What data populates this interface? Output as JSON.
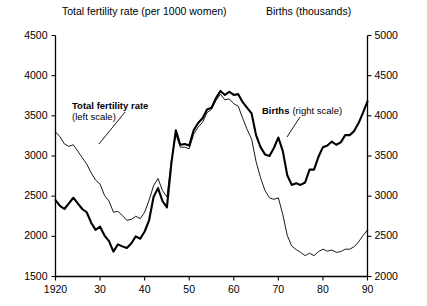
{
  "chart_data": {
    "type": "line",
    "title": "",
    "titles": {
      "left": "Total fertility rate (per 1000 women)",
      "right": "Births (thousands)"
    },
    "xlabel": "",
    "ylabel": "Total fertility rate (per 1000 women)",
    "y2label": "Births (thousands)",
    "grid": false,
    "legend_position": "inline-annotation",
    "xlim": [
      1920,
      1990
    ],
    "ylim": [
      1500,
      4500
    ],
    "y2lim": [
      2000,
      5000
    ],
    "xticks": [
      1920,
      1930,
      1940,
      1950,
      1960,
      1970,
      1980,
      1990
    ],
    "xticklabels": [
      "1920",
      "30",
      "40",
      "50",
      "60",
      "70",
      "80",
      "90"
    ],
    "yticks": [
      1500,
      2000,
      2500,
      3000,
      3500,
      4000,
      4500
    ],
    "yticklabels": [
      "1500",
      "2000",
      "2500",
      "3000",
      "3500",
      "4000",
      "4500"
    ],
    "y2ticks": [
      2000,
      2500,
      3000,
      3500,
      4000,
      4500,
      5000
    ],
    "y2ticklabels": [
      "2000",
      "2500",
      "3000",
      "3500",
      "4000",
      "4500",
      "5000"
    ],
    "annotations": [
      {
        "name": "fertility-label",
        "bold_text": "Total fertility rate",
        "sub_text": "(left scale)"
      },
      {
        "name": "births-label",
        "bold_text": "Births",
        "sub_text": "(right scale)"
      }
    ],
    "x": [
      1920,
      1921,
      1922,
      1923,
      1924,
      1925,
      1926,
      1927,
      1928,
      1929,
      1930,
      1931,
      1932,
      1933,
      1934,
      1935,
      1936,
      1937,
      1938,
      1939,
      1940,
      1941,
      1942,
      1943,
      1944,
      1945,
      1946,
      1947,
      1948,
      1949,
      1950,
      1951,
      1952,
      1953,
      1954,
      1955,
      1956,
      1957,
      1958,
      1959,
      1960,
      1961,
      1962,
      1963,
      1964,
      1965,
      1966,
      1967,
      1968,
      1969,
      1970,
      1971,
      1972,
      1973,
      1974,
      1975,
      1976,
      1977,
      1978,
      1979,
      1980,
      1981,
      1982,
      1983,
      1984,
      1985,
      1986,
      1987,
      1988,
      1989,
      1990
    ],
    "series": [
      {
        "name": "Total fertility rate",
        "axis": "left",
        "style": "thin",
        "unit": "per 1000 women",
        "values": [
          3300,
          3240,
          3150,
          3120,
          3140,
          3060,
          2980,
          2900,
          2790,
          2700,
          2650,
          2510,
          2440,
          2300,
          2310,
          2260,
          2200,
          2210,
          2250,
          2220,
          2300,
          2450,
          2630,
          2720,
          2570,
          2490,
          2940,
          3270,
          3110,
          3110,
          3090,
          3270,
          3360,
          3420,
          3540,
          3580,
          3690,
          3770,
          3700,
          3710,
          3650,
          3620,
          3470,
          3330,
          3210,
          2930,
          2730,
          2570,
          2480,
          2460,
          2480,
          2270,
          2010,
          1880,
          1835,
          1800,
          1760,
          1790,
          1760,
          1810,
          1840,
          1815,
          1830,
          1800,
          1810,
          1840,
          1840,
          1870,
          1930,
          2010,
          2080
        ]
      },
      {
        "name": "Births",
        "axis": "right",
        "style": "bold",
        "unit": "thousands",
        "values": [
          2950,
          2880,
          2840,
          2910,
          2980,
          2910,
          2840,
          2800,
          2670,
          2580,
          2620,
          2510,
          2440,
          2310,
          2400,
          2375,
          2355,
          2410,
          2500,
          2470,
          2560,
          2700,
          2990,
          3100,
          2940,
          2860,
          3410,
          3820,
          3640,
          3650,
          3630,
          3820,
          3910,
          3970,
          4080,
          4100,
          4220,
          4310,
          4260,
          4300,
          4260,
          4270,
          4170,
          4100,
          4030,
          3760,
          3610,
          3520,
          3500,
          3600,
          3730,
          3560,
          3260,
          3140,
          3160,
          3140,
          3170,
          3330,
          3330,
          3490,
          3610,
          3630,
          3680,
          3640,
          3670,
          3760,
          3760,
          3810,
          3910,
          4040,
          4180
        ]
      }
    ]
  },
  "axes": {
    "left_axis_name": "left-value-axis",
    "right_axis_name": "right-value-axis",
    "x_axis_name": "year-axis"
  }
}
